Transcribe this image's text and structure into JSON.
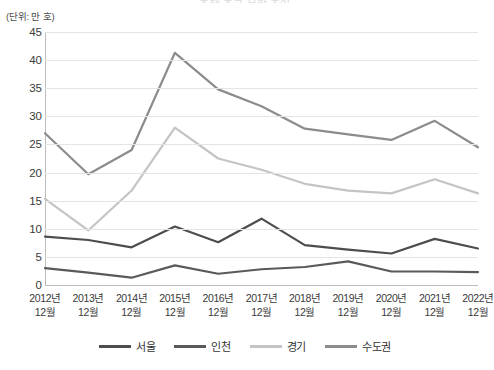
{
  "title": "주택 준공 물량 추이",
  "unit_label": "(단위: 만 호)",
  "axis": {
    "y_ticks": [
      45,
      40,
      35,
      30,
      25,
      20,
      15,
      10,
      5,
      0
    ],
    "x_labels": [
      {
        "year": "2012년",
        "month": "12월"
      },
      {
        "year": "2013년",
        "month": "12월"
      },
      {
        "year": "2014년",
        "month": "12월"
      },
      {
        "year": "2015년",
        "month": "12월"
      },
      {
        "year": "2016년",
        "month": "12월"
      },
      {
        "year": "2017년",
        "month": "12월"
      },
      {
        "year": "2018년",
        "month": "12월"
      },
      {
        "year": "2019년",
        "month": "12월"
      },
      {
        "year": "2020년",
        "month": "12월"
      },
      {
        "year": "2021년",
        "month": "12월"
      },
      {
        "year": "2022년",
        "month": "12월"
      }
    ]
  },
  "legend": {
    "items": [
      {
        "label": "서울",
        "color": "#4d4d4d"
      },
      {
        "label": "인천",
        "color": "#5a5a5a"
      },
      {
        "label": "경기",
        "color": "#c4c4c4"
      },
      {
        "label": "수도권",
        "color": "#8c8c8c"
      }
    ]
  },
  "chart_data": {
    "type": "line",
    "title": "주택 준공 물량 추이",
    "xlabel": "",
    "ylabel": "(단위: 만 호)",
    "ylim": [
      0,
      45
    ],
    "grid": true,
    "legend_position": "bottom",
    "categories": [
      "2012년 12월",
      "2013년 12월",
      "2014년 12월",
      "2015년 12월",
      "2016년 12월",
      "2017년 12월",
      "2018년 12월",
      "2019년 12월",
      "2020년 12월",
      "2021년 12월",
      "2022년 12월"
    ],
    "series": [
      {
        "name": "서울",
        "color": "#4d4d4d",
        "values": [
          8.6,
          8.0,
          6.7,
          10.4,
          7.6,
          11.8,
          7.1,
          6.3,
          5.6,
          8.2,
          6.5
        ]
      },
      {
        "name": "인천",
        "color": "#5a5a5a",
        "values": [
          3.0,
          2.2,
          1.3,
          3.5,
          2.0,
          2.8,
          3.2,
          4.2,
          2.4,
          2.4,
          2.3
        ]
      },
      {
        "name": "경기",
        "color": "#c4c4c4",
        "values": [
          15.3,
          9.7,
          16.8,
          28.0,
          22.5,
          20.5,
          18.0,
          16.8,
          16.3,
          18.8,
          16.3
        ]
      },
      {
        "name": "수도권",
        "color": "#8c8c8c",
        "values": [
          27.0,
          19.7,
          24.0,
          41.3,
          34.8,
          31.8,
          27.8,
          26.8,
          25.8,
          29.2,
          24.5
        ]
      }
    ]
  }
}
